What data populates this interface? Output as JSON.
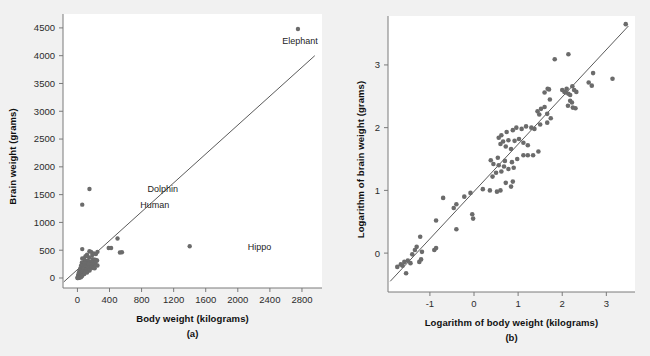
{
  "figure": {
    "background_color": "#f1f1f1",
    "plot_background_color": "#ffffff",
    "point_color": "#6b6b6b",
    "line_color": "#5a5a5a",
    "axis_color": "#7a7a7a"
  },
  "chart_data": [
    {
      "type": "scatter",
      "panel": "a",
      "caption": "(a)",
      "title": "",
      "xlabel": "Body  weight (kilograms)",
      "ylabel": "Brain weight (grams)",
      "xlim": [
        -180,
        3050
      ],
      "ylim": [
        -180,
        4750
      ],
      "xticks": [
        0,
        400,
        800,
        1200,
        1600,
        2000,
        2400,
        2800
      ],
      "xtick_labels": [
        "0",
        "400",
        "800",
        "1200",
        "1600",
        "2000",
        "2400",
        "2800"
      ],
      "yticks": [
        0,
        500,
        1000,
        1500,
        2000,
        2500,
        3000,
        3500,
        4000,
        4500
      ],
      "ytick_labels": [
        "0",
        "500",
        "1000",
        "1500",
        "2000",
        "2500",
        "3000",
        "3500",
        "4000",
        "4500"
      ],
      "grid": false,
      "legend": "none",
      "fit_line": {
        "x0": -170,
        "y0": -70,
        "x1": 2960,
        "y1": 4000
      },
      "annotations": [
        {
          "label": "Elephant",
          "x": 2750,
          "y": 4480,
          "dx": 6,
          "dy": 150
        },
        {
          "label": "Dolphin",
          "x": 150,
          "y": 1600,
          "dx": 58,
          "dy": 20
        },
        {
          "label": "Human",
          "x": 60,
          "y": 1320,
          "dx": 58,
          "dy": 20
        },
        {
          "label": "Hippo",
          "x": 1400,
          "y": 570,
          "dx": 58,
          "dy": 20
        }
      ],
      "points": [
        [
          2750,
          4480
        ],
        [
          150,
          1600
        ],
        [
          60,
          1320
        ],
        [
          1400,
          570
        ],
        [
          500,
          710
        ],
        [
          390,
          540
        ],
        [
          420,
          540
        ],
        [
          530,
          460
        ],
        [
          555,
          462
        ],
        [
          60,
          520
        ],
        [
          150,
          480
        ],
        [
          170,
          470
        ],
        [
          250,
          470
        ],
        [
          205,
          440
        ],
        [
          230,
          430
        ],
        [
          120,
          420
        ],
        [
          185,
          415
        ],
        [
          100,
          390
        ],
        [
          145,
          370
        ],
        [
          60,
          350
        ],
        [
          80,
          345
        ],
        [
          190,
          340
        ],
        [
          215,
          330
        ],
        [
          230,
          325
        ],
        [
          245,
          315
        ],
        [
          95,
          310
        ],
        [
          110,
          305
        ],
        [
          130,
          300
        ],
        [
          155,
          295
        ],
        [
          175,
          290
        ],
        [
          200,
          285
        ],
        [
          225,
          280
        ],
        [
          55,
          275
        ],
        [
          70,
          270
        ],
        [
          85,
          265
        ],
        [
          100,
          260
        ],
        [
          120,
          255
        ],
        [
          140,
          250
        ],
        [
          160,
          245
        ],
        [
          185,
          240
        ],
        [
          205,
          235
        ],
        [
          230,
          230
        ],
        [
          250,
          225
        ],
        [
          45,
          220
        ],
        [
          58,
          215
        ],
        [
          72,
          210
        ],
        [
          88,
          205
        ],
        [
          105,
          200
        ],
        [
          125,
          195
        ],
        [
          148,
          190
        ],
        [
          170,
          185
        ],
        [
          195,
          180
        ],
        [
          215,
          175
        ],
        [
          35,
          170
        ],
        [
          48,
          165
        ],
        [
          62,
          160
        ],
        [
          78,
          155
        ],
        [
          95,
          150
        ],
        [
          112,
          145
        ],
        [
          132,
          140
        ],
        [
          152,
          135
        ],
        [
          25,
          130
        ],
        [
          38,
          125
        ],
        [
          52,
          120
        ],
        [
          68,
          115
        ],
        [
          85,
          110
        ],
        [
          102,
          105
        ],
        [
          120,
          100
        ],
        [
          18,
          95
        ],
        [
          30,
          90
        ],
        [
          42,
          85
        ],
        [
          56,
          80
        ],
        [
          70,
          75
        ],
        [
          86,
          70
        ],
        [
          12,
          62
        ],
        [
          22,
          56
        ],
        [
          33,
          50
        ],
        [
          45,
          44
        ],
        [
          58,
          38
        ],
        [
          8,
          32
        ],
        [
          16,
          27
        ],
        [
          25,
          22
        ],
        [
          34,
          18
        ],
        [
          44,
          14
        ],
        [
          5,
          10
        ],
        [
          10,
          7
        ],
        [
          16,
          5
        ],
        [
          22,
          4
        ],
        [
          3,
          2
        ],
        [
          7,
          1
        ],
        [
          1,
          0
        ]
      ]
    },
    {
      "type": "scatter",
      "panel": "b",
      "caption": "(b)",
      "title": "",
      "xlabel": "Logarithm of body weight (kilograms)",
      "ylabel": "Logarithm of brain weight (grams)",
      "xlim": [
        -1.95,
        3.65
      ],
      "ylim": [
        -0.62,
        3.78
      ],
      "xticks": [
        -1,
        0,
        1,
        2,
        3
      ],
      "xtick_labels": [
        "-1",
        "0",
        "1",
        "2",
        "3"
      ],
      "yticks": [
        0,
        1,
        2,
        3
      ],
      "ytick_labels": [
        "0",
        "1",
        "2",
        "3"
      ],
      "grid": false,
      "legend": "none",
      "fit_line": {
        "x0": -1.9,
        "y0": -0.45,
        "x1": 3.5,
        "y1": 3.62
      },
      "annotations": [],
      "points": [
        [
          3.44,
          3.65
        ],
        [
          1.83,
          3.09
        ],
        [
          2.14,
          3.17
        ],
        [
          1.67,
          2.62
        ],
        [
          1.7,
          2.61
        ],
        [
          1.6,
          2.56
        ],
        [
          2.0,
          2.6
        ],
        [
          2.05,
          2.57
        ],
        [
          2.08,
          2.56
        ],
        [
          2.1,
          2.62
        ],
        [
          2.14,
          2.54
        ],
        [
          2.18,
          2.52
        ],
        [
          2.23,
          2.66
        ],
        [
          2.27,
          2.6
        ],
        [
          2.32,
          2.57
        ],
        [
          2.6,
          2.72
        ],
        [
          2.67,
          2.67
        ],
        [
          2.7,
          2.87
        ],
        [
          3.14,
          2.78
        ],
        [
          2.24,
          2.32
        ],
        [
          2.3,
          2.31
        ],
        [
          2.18,
          2.43
        ],
        [
          2.22,
          2.4
        ],
        [
          2.13,
          2.35
        ],
        [
          1.72,
          2.45
        ],
        [
          1.6,
          2.33
        ],
        [
          1.52,
          2.3
        ],
        [
          1.48,
          2.21
        ],
        [
          1.44,
          2.26
        ],
        [
          1.66,
          2.22
        ],
        [
          1.74,
          2.15
        ],
        [
          1.66,
          2.08
        ],
        [
          1.5,
          2.05
        ],
        [
          1.37,
          1.98
        ],
        [
          1.3,
          2.0
        ],
        [
          1.18,
          2.02
        ],
        [
          1.08,
          1.98
        ],
        [
          0.96,
          2.0
        ],
        [
          0.88,
          1.96
        ],
        [
          0.74,
          1.93
        ],
        [
          0.62,
          1.88
        ],
        [
          0.56,
          1.84
        ],
        [
          0.66,
          1.78
        ],
        [
          0.78,
          1.8
        ],
        [
          0.92,
          1.79
        ],
        [
          1.02,
          1.82
        ],
        [
          1.12,
          1.76
        ],
        [
          1.22,
          1.72
        ],
        [
          0.6,
          1.74
        ],
        [
          0.72,
          1.7
        ],
        [
          0.84,
          1.66
        ],
        [
          1.46,
          1.62
        ],
        [
          1.34,
          1.56
        ],
        [
          1.22,
          1.56
        ],
        [
          1.12,
          1.56
        ],
        [
          0.98,
          1.5
        ],
        [
          0.86,
          1.45
        ],
        [
          0.7,
          1.47
        ],
        [
          0.54,
          1.52
        ],
        [
          0.38,
          1.48
        ],
        [
          0.44,
          1.42
        ],
        [
          0.56,
          1.4
        ],
        [
          0.68,
          1.38
        ],
        [
          0.78,
          1.34
        ],
        [
          0.9,
          1.36
        ],
        [
          0.62,
          1.3
        ],
        [
          0.5,
          1.28
        ],
        [
          0.42,
          1.22
        ],
        [
          0.72,
          1.12
        ],
        [
          0.84,
          1.06
        ],
        [
          0.88,
          1.14
        ],
        [
          0.6,
          1.0
        ],
        [
          0.52,
          0.98
        ],
        [
          0.36,
          1.0
        ],
        [
          0.2,
          1.02
        ],
        [
          -0.08,
          0.96
        ],
        [
          -0.22,
          0.9
        ],
        [
          -0.4,
          0.78
        ],
        [
          -0.46,
          0.72
        ],
        [
          -0.7,
          0.88
        ],
        [
          -0.86,
          0.52
        ],
        [
          -0.4,
          0.38
        ],
        [
          -0.04,
          0.62
        ],
        [
          -0.02,
          0.55
        ],
        [
          -1.22,
          0.26
        ],
        [
          -1.3,
          0.1
        ],
        [
          -1.34,
          0.05
        ],
        [
          -1.4,
          -0.02
        ],
        [
          -0.9,
          0.05
        ],
        [
          -0.86,
          0.08
        ],
        [
          -1.18,
          0.02
        ],
        [
          -1.5,
          -0.12
        ],
        [
          -1.58,
          -0.14
        ],
        [
          -1.44,
          -0.16
        ],
        [
          -1.62,
          -0.2
        ],
        [
          -1.66,
          -0.18
        ],
        [
          -1.54,
          -0.32
        ],
        [
          -1.24,
          -0.14
        ],
        [
          -1.2,
          -0.1
        ],
        [
          -1.74,
          -0.22
        ]
      ]
    }
  ]
}
